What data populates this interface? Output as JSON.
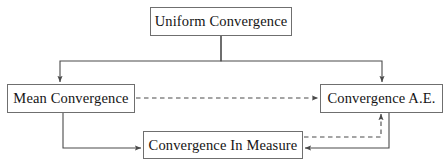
{
  "diagram": {
    "type": "flow-diagram",
    "canvas": {
      "width": 445,
      "height": 167
    },
    "style": {
      "background_color": "#ffffff",
      "box_border_color": "#6f6f6f",
      "box_fill_color": "#ffffff",
      "text_color": "#141414",
      "arrow_color": "#4a4a4a"
    },
    "nodes": [
      {
        "id": "uniform_convergence",
        "label": "Uniform Convergence",
        "x": 150,
        "y": 7,
        "width": 142,
        "height": 29
      },
      {
        "id": "mean_convergence",
        "label": "Mean Convergence",
        "x": 7,
        "y": 84,
        "width": 128,
        "height": 29
      },
      {
        "id": "convergence_ae",
        "label": "Convergence A.E.",
        "x": 320,
        "y": 84,
        "width": 123,
        "height": 29
      },
      {
        "id": "convergence_in_measure",
        "label": "Convergence In Measure",
        "x": 143,
        "y": 131,
        "width": 160,
        "height": 28
      }
    ],
    "edges": [
      {
        "id": "uniform_to_mean",
        "from": "uniform_convergence",
        "to": "mean_convergence",
        "line_style": "solid",
        "arrowhead": "end",
        "path": "M221,36 L221,61 L60,61 L60,82"
      },
      {
        "id": "uniform_to_ae",
        "from": "uniform_convergence",
        "to": "convergence_ae",
        "line_style": "solid",
        "arrowhead": "end",
        "path": "M221,36 L221,61 L382,61 L382,82"
      },
      {
        "id": "mean_to_ae",
        "from": "mean_convergence",
        "to": "convergence_ae",
        "line_style": "dashed",
        "arrowhead": "end",
        "path": "M136,98 L318,98"
      },
      {
        "id": "mean_to_in_measure",
        "from": "mean_convergence",
        "to": "convergence_in_measure",
        "line_style": "solid",
        "arrowhead": "end",
        "path": "M63,113 L63,148 L141,148"
      },
      {
        "id": "in_measure_to_ae",
        "from": "convergence_in_measure",
        "to": "convergence_ae",
        "line_style": "dashed",
        "arrowhead": "end",
        "path": "M304,137 L381,137 L381,114"
      },
      {
        "id": "ae_to_in_measure",
        "from": "convergence_ae",
        "to": "convergence_in_measure",
        "line_style": "solid",
        "arrowhead": "end",
        "path": "M389,113 L389,148 L305,148"
      }
    ]
  }
}
